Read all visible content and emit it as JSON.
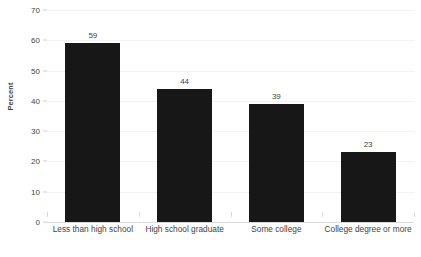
{
  "chart_data": {
    "type": "bar",
    "title": "",
    "xlabel": "",
    "ylabel": "Percent",
    "ylim": [
      0,
      70
    ],
    "ytick_step": 10,
    "yticks": [
      0,
      10,
      20,
      30,
      40,
      50,
      60,
      70
    ],
    "grid": true,
    "legend": "none",
    "categories": [
      "Less than high school",
      "High school graduate",
      "Some college",
      "College degree or more"
    ],
    "values": [
      59,
      44,
      39,
      23
    ],
    "data_labels": [
      "59",
      "44",
      "39",
      "23"
    ],
    "bar_color": "#171717",
    "text_color": "#3f3f3f",
    "grid_color": "#f2f2f2",
    "axis_color": "#d9d9d9",
    "background": "#ffffff"
  }
}
